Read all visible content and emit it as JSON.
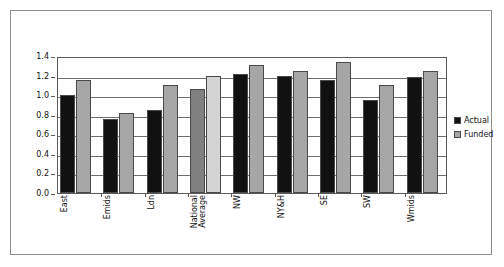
{
  "chart_data": {
    "type": "bar",
    "title": "",
    "subtitle": "",
    "xlabel": "",
    "ylabel": "",
    "ylim": [
      0.0,
      1.4
    ],
    "ytick_labels": [
      "1.4",
      "1.2",
      "1.0",
      "0.8",
      "0.6",
      "0.4",
      "0.2",
      "0.0"
    ],
    "ytick_values": [
      1.4,
      1.2,
      1.0,
      0.8,
      0.6,
      0.4,
      0.2,
      0.0
    ],
    "grid": true,
    "legend_position": "right",
    "categories": [
      "East",
      "Emids",
      "Ldn",
      "National Average",
      "NW",
      "NY&H",
      "SE",
      "SW",
      "Wmids"
    ],
    "series": [
      {
        "name": "Actual",
        "color": "#111111",
        "values": [
          1.0,
          0.76,
          0.85,
          1.06,
          1.22,
          1.2,
          1.15,
          0.95,
          1.19
        ]
      },
      {
        "name": "Funded",
        "color": "#a6a6a6",
        "values": [
          1.15,
          0.82,
          1.1,
          1.2,
          1.31,
          1.25,
          1.34,
          1.1,
          1.25
        ]
      }
    ],
    "highlight_category": "National Average",
    "highlight_colors": {
      "Actual": "#808080",
      "Funded": "#d4d4d4"
    }
  },
  "legend": {
    "items": [
      {
        "label": "Actual",
        "color": "#111111"
      },
      {
        "label": "Funded",
        "color": "#a6a6a6"
      }
    ]
  },
  "colors": {
    "frame": "#8c8c8c",
    "axis": "#5a5a5a",
    "gridline": "#6e6e6e",
    "background": "#ffffff",
    "actual": "#111111",
    "funded": "#a6a6a6"
  }
}
